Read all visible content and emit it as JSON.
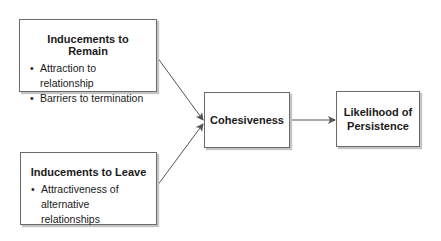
{
  "diagram": {
    "nodes": {
      "remain": {
        "title": "Inducements to Remain",
        "bullets": [
          "Attraction to relationship",
          "Barriers to termination"
        ]
      },
      "leave": {
        "title": "Inducements to Leave",
        "bullets": [
          "Attractiveness of alternative relationships"
        ]
      },
      "cohesiveness": {
        "title": "Cohesiveness"
      },
      "persistence": {
        "title": "Likelihood of Persistence",
        "line1": "Likelihood of",
        "line2": "Persistence"
      }
    },
    "bullet_glyph": "•",
    "edges": [
      {
        "from": "Inducements to Remain",
        "to": "Cohesiveness"
      },
      {
        "from": "Inducements to Leave",
        "to": "Cohesiveness"
      },
      {
        "from": "Cohesiveness",
        "to": "Likelihood of Persistence"
      }
    ],
    "colors": {
      "border": "#6a6a6a",
      "arrow": "#555555",
      "shadow": "#c4c4c4"
    }
  }
}
